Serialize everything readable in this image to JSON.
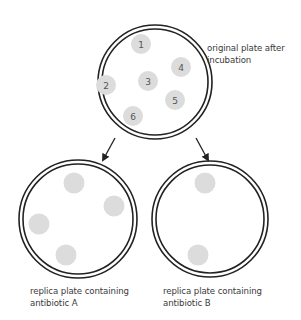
{
  "colors": {
    "plate_outline": "#222222",
    "colony_fill": "#dcdcdc",
    "text": "#3a3a3a",
    "background": "#ffffff"
  },
  "original_plate": {
    "label_line1": "original plate after",
    "label_line2": "incubation",
    "colonies": [
      "1",
      "2",
      "3",
      "4",
      "5",
      "6"
    ]
  },
  "replica_a": {
    "label_line1": "replica plate containing",
    "label_line2": "antibiotic A",
    "colony_count": 4
  },
  "replica_b": {
    "label_line1": "replica plate containing",
    "label_line2": "antibiotic B",
    "colony_count": 2
  }
}
